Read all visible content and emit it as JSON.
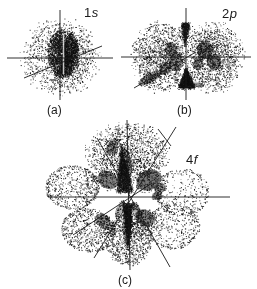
{
  "figure": {
    "background_color": "#ffffff",
    "ink_color": "#1a1a1a",
    "orbitals": [
      {
        "name": "1s orbital",
        "label": "1s",
        "label_num": "1",
        "label_letter": "s",
        "caption": "(a)"
      },
      {
        "name": "2p orbital",
        "label": "2p",
        "label_num": "2",
        "label_letter": "p",
        "caption": "(b)"
      },
      {
        "name": "4f orbital",
        "label": "4f",
        "label_num": "4",
        "label_letter": "f",
        "caption": "(c)"
      }
    ]
  }
}
